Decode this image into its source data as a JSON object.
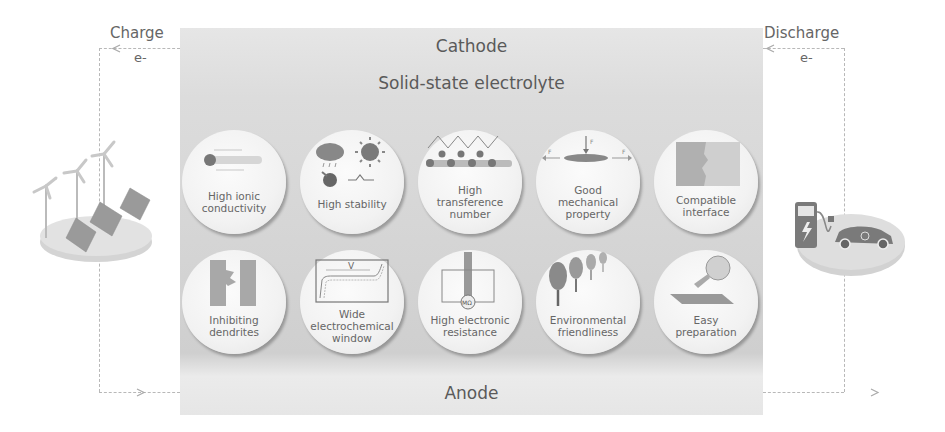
{
  "left": {
    "label": "Charge",
    "electron": "e-",
    "illustration": "renewable-energy-platform"
  },
  "right": {
    "label": "Discharge",
    "electron": "e-",
    "illustration": "ev-charging-platform"
  },
  "panel": {
    "cathode": "Cathode",
    "electrolyte": "Solid-state electrolyte",
    "anode": "Anode"
  },
  "properties": [
    {
      "label": "High ionic conductivity",
      "lines": [
        "High ionic",
        "conductivity"
      ],
      "icon": "ion-rod-icon"
    },
    {
      "label": "High stability",
      "lines": [
        "High stability"
      ],
      "icon": "weather-chemical-stability-icon"
    },
    {
      "label": "High transference number",
      "lines": [
        "High",
        "transference",
        "number"
      ],
      "icon": "ion-chain-icon"
    },
    {
      "label": "Good mechanical property",
      "lines": [
        "Good",
        "mechanical",
        "property"
      ],
      "icon": "force-disc-icon"
    },
    {
      "label": "Compatible interface",
      "lines": [
        "Compatible",
        "interface"
      ],
      "icon": "interface-block-icon"
    },
    {
      "label": "Inhibiting dendrites",
      "lines": [
        "Inhibiting",
        "dendrites"
      ],
      "icon": "dendrite-block-icon"
    },
    {
      "label": "Wide electrochemical window",
      "lines": [
        "Wide",
        "electrochemical",
        "window"
      ],
      "icon": "voltage-window-icon",
      "icon_text": "V"
    },
    {
      "label": "High electronic resistance",
      "lines": [
        "High electronic",
        "resistance"
      ],
      "icon": "megaohm-circuit-icon",
      "icon_text": "MΩ"
    },
    {
      "label": "Environmental friendliness",
      "lines": [
        "Environmental",
        "friendliness"
      ],
      "icon": "trees-icon"
    },
    {
      "label": "Easy preparation",
      "lines": [
        "Easy",
        "preparation"
      ],
      "icon": "flask-substrate-icon"
    }
  ],
  "colors": {
    "panel": "#d8d8d8",
    "circle": "#f3f3f3",
    "text": "#5a5a5a",
    "wire": "#b8b8b8",
    "icon_dark": "#777777"
  }
}
